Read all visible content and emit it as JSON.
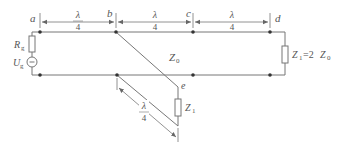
{
  "diagram": {
    "type": "transmission-line-circuit",
    "colors": {
      "line": "#666666",
      "text": "#555555",
      "background": "#ffffff"
    },
    "nodes": {
      "a": "a",
      "b": "b",
      "c": "c",
      "d": "d",
      "e": "e"
    },
    "source": {
      "resistor_label": "R",
      "resistor_sub": "g",
      "voltage_label": "U",
      "voltage_sub": "g"
    },
    "line": {
      "impedance_label": "Z",
      "impedance_sub": "0"
    },
    "load": {
      "label": "Z",
      "label_sub": "1",
      "equals": "=2",
      "ref": "Z",
      "ref_sub": "0"
    },
    "stub_load": {
      "label": "Z",
      "label_sub": "1"
    },
    "dimensions": [
      {
        "id": "ab",
        "num": "λ",
        "den": "4"
      },
      {
        "id": "bc",
        "num": "λ",
        "den": "4"
      },
      {
        "id": "cd",
        "num": "λ",
        "den": "4"
      },
      {
        "id": "stub",
        "num": "λ",
        "den": "4"
      }
    ]
  }
}
